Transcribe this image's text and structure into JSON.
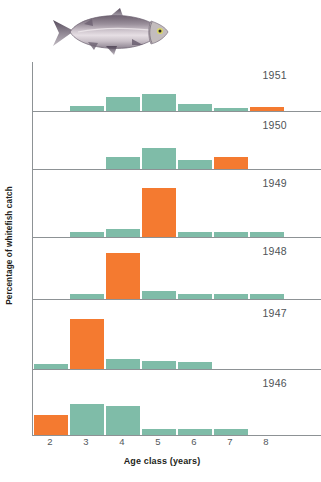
{
  "figure": {
    "illustration_name": "whitefish-illustration",
    "ylabel": "Percentage of whitefish catch",
    "xlabel": "Age class (years)",
    "green_hex": "#7FBCA8",
    "orange_hex": "#F47A30",
    "axis_hex": "#8D9295"
  },
  "chart_data": {
    "type": "bar",
    "title": "",
    "xlabel": "Age class (years)",
    "ylabel": "Percentage of whitefish catch",
    "xlim": [
      1.5,
      8.5
    ],
    "ylim": [
      0,
      100
    ],
    "grid": false,
    "legend": "none",
    "categories": [
      2,
      3,
      4,
      5,
      6,
      7,
      8
    ],
    "tick_labels": [
      "2",
      "3",
      "4",
      "5",
      "6",
      "7",
      "8"
    ],
    "highlight_color": "#F47A30",
    "base_color": "#7FBCA8",
    "panel_order_top_to_bottom": [
      "1951",
      "1950",
      "1949",
      "1948",
      "1947",
      "1946"
    ],
    "panels": [
      {
        "label": "1951",
        "cohort_age": 7,
        "bars": [
          {
            "age": 2,
            "value": 0,
            "color": "#7FBCA8"
          },
          {
            "age": 3,
            "value": 11,
            "color": "#7FBCA8"
          },
          {
            "age": 4,
            "value": 31,
            "color": "#7FBCA8"
          },
          {
            "age": 5,
            "value": 38,
            "color": "#7FBCA8"
          },
          {
            "age": 6,
            "value": 14,
            "color": "#7FBCA8"
          },
          {
            "age": 7,
            "value": 7,
            "color": "#7FBCA8"
          },
          {
            "age": 8,
            "value": 9,
            "color": "#F47A30"
          }
        ]
      },
      {
        "label": "1950",
        "cohort_age": 6,
        "bars": [
          {
            "age": 2,
            "value": 0,
            "color": "#7FBCA8"
          },
          {
            "age": 3,
            "value": 0,
            "color": "#7FBCA8"
          },
          {
            "age": 4,
            "value": 22,
            "color": "#7FBCA8"
          },
          {
            "age": 5,
            "value": 40,
            "color": "#7FBCA8"
          },
          {
            "age": 6,
            "value": 16,
            "color": "#7FBCA8"
          },
          {
            "age": 7,
            "value": 23,
            "color": "#F47A30"
          },
          {
            "age": 8,
            "value": 0,
            "color": "#7FBCA8"
          }
        ]
      },
      {
        "label": "1949",
        "cohort_age": 5,
        "bars": [
          {
            "age": 2,
            "value": 0,
            "color": "#7FBCA8"
          },
          {
            "age": 3,
            "value": 8,
            "color": "#7FBCA8"
          },
          {
            "age": 4,
            "value": 12,
            "color": "#7FBCA8"
          },
          {
            "age": 5,
            "value": 78,
            "color": "#F47A30"
          },
          {
            "age": 6,
            "value": 8,
            "color": "#7FBCA8"
          },
          {
            "age": 7,
            "value": 7,
            "color": "#7FBCA8"
          },
          {
            "age": 8,
            "value": 7,
            "color": "#7FBCA8"
          }
        ]
      },
      {
        "label": "1948",
        "cohort_age": 4,
        "bars": [
          {
            "age": 2,
            "value": 0,
            "color": "#7FBCA8"
          },
          {
            "age": 3,
            "value": 8,
            "color": "#7FBCA8"
          },
          {
            "age": 4,
            "value": 80,
            "color": "#F47A30"
          },
          {
            "age": 5,
            "value": 13,
            "color": "#7FBCA8"
          },
          {
            "age": 6,
            "value": 8,
            "color": "#7FBCA8"
          },
          {
            "age": 7,
            "value": 8,
            "color": "#7FBCA8"
          },
          {
            "age": 8,
            "value": 8,
            "color": "#7FBCA8"
          }
        ]
      },
      {
        "label": "1947",
        "cohort_age": 3,
        "bars": [
          {
            "age": 2,
            "value": 8,
            "color": "#7FBCA8"
          },
          {
            "age": 3,
            "value": 76,
            "color": "#F47A30"
          },
          {
            "age": 4,
            "value": 15,
            "color": "#7FBCA8"
          },
          {
            "age": 5,
            "value": 12,
            "color": "#7FBCA8"
          },
          {
            "age": 6,
            "value": 10,
            "color": "#7FBCA8"
          },
          {
            "age": 7,
            "value": 0,
            "color": "#7FBCA8"
          },
          {
            "age": 8,
            "value": 0,
            "color": "#7FBCA8"
          }
        ]
      },
      {
        "label": "1946",
        "cohort_age": 2,
        "bars": [
          {
            "age": 2,
            "value": 33,
            "color": "#F47A30"
          },
          {
            "age": 3,
            "value": 50,
            "color": "#7FBCA8"
          },
          {
            "age": 4,
            "value": 47,
            "color": "#7FBCA8"
          },
          {
            "age": 5,
            "value": 10,
            "color": "#7FBCA8"
          },
          {
            "age": 6,
            "value": 10,
            "color": "#7FBCA8"
          },
          {
            "age": 7,
            "value": 10,
            "color": "#7FBCA8"
          },
          {
            "age": 8,
            "value": 0,
            "color": "#7FBCA8"
          }
        ]
      }
    ]
  }
}
